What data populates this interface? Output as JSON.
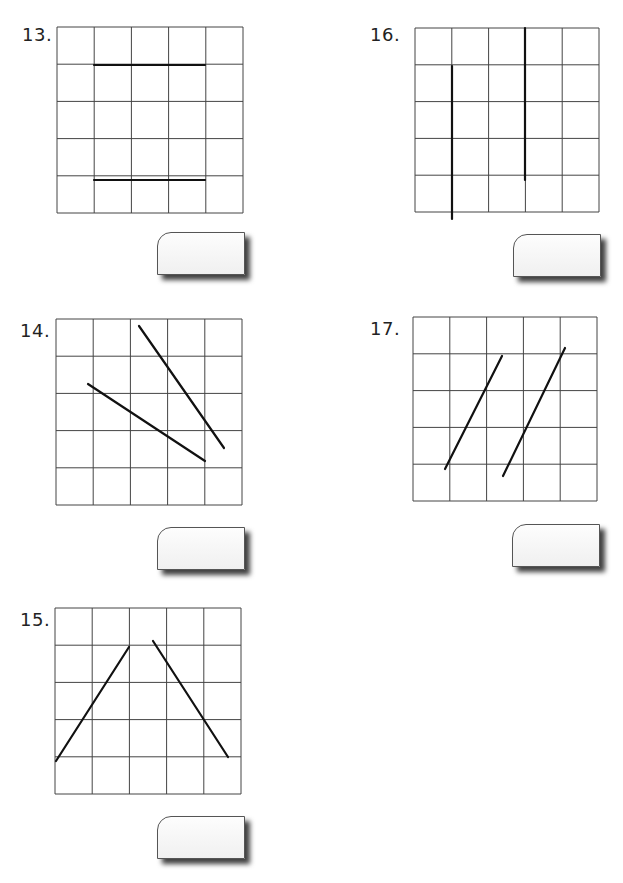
{
  "problems": [
    {
      "number": "13.",
      "label_pos": [
        22,
        24
      ],
      "grid": {
        "x": 57,
        "y": 27,
        "size": 186,
        "rows": 5,
        "cols": 5
      },
      "segments": [
        [
          94,
          65,
          205,
          65
        ],
        [
          94,
          180,
          205,
          180
        ]
      ],
      "answer_box": {
        "x": 157,
        "y": 232
      }
    },
    {
      "number": "14.",
      "label_pos": [
        20,
        320
      ],
      "grid": {
        "x": 56,
        "y": 319,
        "size": 186,
        "rows": 5,
        "cols": 5
      },
      "segments": [
        [
          88,
          384,
          205,
          461
        ],
        [
          139,
          326,
          224,
          448
        ]
      ],
      "answer_box": {
        "x": 157,
        "y": 527
      }
    },
    {
      "number": "15.",
      "label_pos": [
        20,
        609
      ],
      "grid": {
        "x": 55,
        "y": 608,
        "size": 186,
        "rows": 5,
        "cols": 5
      },
      "segments": [
        [
          56,
          761,
          129,
          647
        ],
        [
          153,
          641,
          228,
          757
        ]
      ],
      "answer_box": {
        "x": 157,
        "y": 816
      }
    },
    {
      "number": "16.",
      "label_pos": [
        370,
        24
      ],
      "grid": {
        "x": 415,
        "y": 28,
        "size": 184,
        "rows": 5,
        "cols": 5
      },
      "segments": [
        [
          452,
          66,
          452,
          219
        ],
        [
          525,
          28,
          525,
          180
        ]
      ],
      "answer_box": {
        "x": 513,
        "y": 234
      }
    },
    {
      "number": "17.",
      "label_pos": [
        370,
        318
      ],
      "grid": {
        "x": 413,
        "y": 317,
        "size": 184,
        "rows": 5,
        "cols": 5
      },
      "segments": [
        [
          445,
          469,
          502,
          356
        ],
        [
          503,
          476,
          565,
          348
        ]
      ],
      "answer_box": {
        "x": 512,
        "y": 524
      }
    }
  ]
}
